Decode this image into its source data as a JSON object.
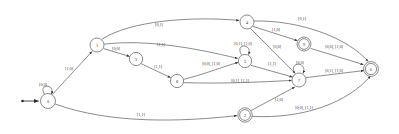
{
  "figure": {
    "kind": "finite-state-machine-diagram",
    "width": 399,
    "height": 134,
    "background_color": "#ffffff",
    "stroke_color": "#5a5a5a",
    "text_color": "#2b2b2b"
  },
  "start": {
    "label": "",
    "target_state": "0"
  },
  "states": [
    {
      "id": "s0",
      "label": "0",
      "x": 48,
      "y": 101,
      "r": 7.5,
      "accepting": false
    },
    {
      "id": "s1",
      "label": "1",
      "x": 97,
      "y": 45,
      "r": 7.0,
      "accepting": false
    },
    {
      "id": "s3",
      "label": "3",
      "x": 136,
      "y": 59,
      "r": 6.6,
      "accepting": false
    },
    {
      "id": "s8",
      "label": "8",
      "x": 177,
      "y": 81,
      "r": 6.6,
      "accepting": false
    },
    {
      "id": "s4",
      "label": "4",
      "x": 247,
      "y": 22,
      "r": 7.0,
      "accepting": false
    },
    {
      "id": "s5",
      "label": "5",
      "x": 245,
      "y": 61,
      "r": 6.6,
      "accepting": false
    },
    {
      "id": "s9",
      "label": "9",
      "x": 304,
      "y": 44,
      "r": 7.0,
      "accepting": true
    },
    {
      "id": "s2",
      "label": "2",
      "x": 245,
      "y": 115,
      "r": 7.2,
      "accepting": true
    },
    {
      "id": "s7",
      "label": "7",
      "x": 299,
      "y": 80,
      "r": 7.0,
      "accepting": false
    },
    {
      "id": "s6",
      "label": "6",
      "x": 371,
      "y": 69,
      "r": 7.4,
      "accepting": true
    }
  ],
  "transitions": [
    {
      "from": "s0",
      "to": "s0",
      "label": "[0,0]",
      "kind": "self"
    },
    {
      "from": "s0",
      "to": "s1",
      "label": "[1,0]",
      "kind": "edge"
    },
    {
      "from": "s0",
      "to": "s2",
      "label": "[1,1]",
      "kind": "edge"
    },
    {
      "from": "s1",
      "to": "s4",
      "label": "[0,1]",
      "kind": "edge"
    },
    {
      "from": "s1",
      "to": "s3",
      "label": "[0,0]",
      "kind": "edge"
    },
    {
      "from": "s1",
      "to": "s5",
      "label": "[1,1]",
      "kind": "edge"
    },
    {
      "from": "s3",
      "to": "s8",
      "label": "[1,1]",
      "kind": "edge"
    },
    {
      "from": "s8",
      "to": "s5",
      "label": "[0,0], [1,0]",
      "kind": "edge"
    },
    {
      "from": "s8",
      "to": "s7",
      "label": "[0,1], [1,1]",
      "kind": "edge"
    },
    {
      "from": "s4",
      "to": "s9",
      "label": "[1,0]",
      "kind": "edge"
    },
    {
      "from": "s4",
      "to": "s7",
      "label": "[0,0]",
      "kind": "edge"
    },
    {
      "from": "s4",
      "to": "s6",
      "label": "[0,1]",
      "kind": "edge"
    },
    {
      "from": "s5",
      "to": "s5",
      "label": "[0,1], [1,0]",
      "kind": "self"
    },
    {
      "from": "s5",
      "to": "s7",
      "label": "[1,1]",
      "kind": "edge"
    },
    {
      "from": "s9",
      "to": "s6",
      "label": "[0,0], [1,0]",
      "kind": "edge"
    },
    {
      "from": "s7",
      "to": "s7",
      "label": "[0,0]",
      "kind": "self"
    },
    {
      "from": "s7",
      "to": "s6",
      "label": "[0,1], [1,0]",
      "kind": "edge"
    },
    {
      "from": "s2",
      "to": "s7",
      "label": "[1,0]",
      "kind": "edge"
    },
    {
      "from": "s2",
      "to": "s6",
      "label": "[0,0], [1,1]",
      "kind": "edge"
    }
  ],
  "edge_labels": {
    "l_s0_s0": {
      "text": "[0,0]",
      "x": 43,
      "y": 84
    },
    "l_s0_s1": {
      "text": "[1,0]",
      "x": 69,
      "y": 68
    },
    "l_s0_s2": {
      "text": "[1,1]",
      "x": 141,
      "y": 114
    },
    "l_s1_s4": {
      "text": "[0,1]",
      "x": 159,
      "y": 24
    },
    "l_s1_s3": {
      "text": "[0,0]",
      "x": 116,
      "y": 48
    },
    "l_s1_s5": {
      "text": "[1,1]",
      "x": 161,
      "y": 44
    },
    "l_s3_s8": {
      "text": "[1,1]",
      "x": 158,
      "y": 66
    },
    "l_s8_s5": {
      "text": "[0,0], [1,0]",
      "x": 211,
      "y": 63
    },
    "l_s8_s7": {
      "text": "[0,1], [1,1]",
      "x": 240,
      "y": 80
    },
    "l_s4_s9": {
      "text": "[1,0]",
      "x": 276,
      "y": 29
    },
    "l_s4_s7": {
      "text": "[0,0]",
      "x": 277,
      "y": 46
    },
    "l_s4_s6": {
      "text": "[0,1]",
      "x": 302,
      "y": 18
    },
    "l_s5_s5": {
      "text": "[0,1], [1,0]",
      "x": 243,
      "y": 43
    },
    "l_s5_s7": {
      "text": "[1,1]",
      "x": 272,
      "y": 63
    },
    "l_s9_s6": {
      "text": "[0,0], [1,0]",
      "x": 334,
      "y": 46
    },
    "l_s7_s7": {
      "text": "[0,0]",
      "x": 300,
      "y": 62
    },
    "l_s7_s6": {
      "text": "[0,1], [1,0]",
      "x": 334,
      "y": 70
    },
    "l_s2_s7": {
      "text": "[1,0]",
      "x": 279,
      "y": 99
    },
    "l_s2_s6": {
      "text": "[0,0], [1,1]",
      "x": 304,
      "y": 107
    }
  }
}
